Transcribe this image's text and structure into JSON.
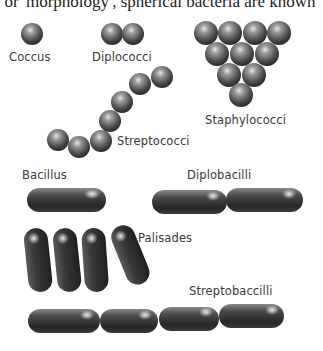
{
  "intro_text": ", or 'morphology', spherical bacteria are known",
  "colors": {
    "background": "#ffffff",
    "text": "#3a3a3a",
    "sphere_light": "#d9d9d9",
    "sphere_mid": "#6e6e6e",
    "sphere_dark": "#2a2a2a",
    "rod_dark": "#2b2b2b"
  },
  "labels": {
    "coccus": "Coccus",
    "diplococci": "Diplococci",
    "staphylococci": "Staphylococci",
    "streptococci": "Streptococci",
    "bacillus": "Bacillus",
    "diplobacilli": "Diplobacilli",
    "palisades": "Palisades",
    "streptobacilli": "Streptobaccilli"
  },
  "groups": [
    {
      "name": "Coccus",
      "shape": "sphere",
      "count": 1
    },
    {
      "name": "Diplococci",
      "shape": "sphere",
      "count": 2
    },
    {
      "name": "Staphylococci",
      "shape": "sphere",
      "count": 10
    },
    {
      "name": "Streptococci",
      "shape": "sphere",
      "count": 7
    },
    {
      "name": "Bacillus",
      "shape": "rod",
      "count": 1
    },
    {
      "name": "Diplobacilli",
      "shape": "rod",
      "count": 2
    },
    {
      "name": "Palisades",
      "shape": "rod",
      "count": 4
    },
    {
      "name": "Streptobaccilli",
      "shape": "rod",
      "count": 4
    }
  ]
}
